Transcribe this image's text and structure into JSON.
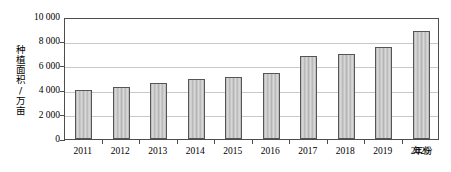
{
  "chart_data": {
    "type": "bar",
    "title": "",
    "subtitle": "",
    "xlabel": "年份",
    "ylabel": "种植面积/万亩",
    "categories": [
      "2011",
      "2012",
      "2013",
      "2014",
      "2015",
      "2016",
      "2017",
      "2018",
      "2019",
      "2020"
    ],
    "values": [
      4000,
      4300,
      4600,
      4900,
      5050,
      5400,
      6800,
      7000,
      7550,
      8850
    ],
    "series": [
      {
        "name": "种植面积",
        "values": [
          4000,
          4300,
          4600,
          4900,
          5050,
          5400,
          6800,
          7000,
          7550,
          8850
        ]
      }
    ],
    "ylim": [
      0,
      10000
    ],
    "ytick_values": [
      0,
      2000,
      4000,
      6000,
      8000,
      10000
    ],
    "ytick_labels": [
      "0",
      "2 000",
      "4 000",
      "6 000",
      "8 000",
      "10 000"
    ],
    "grid": "horizontal",
    "legend": "none",
    "annotations": [],
    "bar_color": "#b4b4b4",
    "bar_border_color": "#555555",
    "gridline_color": "#c8c8c8",
    "axis_color": "#4d4d4d",
    "plot_background": "#ffffff"
  },
  "axes": {
    "y_title": "种植面积/万亩",
    "x_title": "年份"
  }
}
